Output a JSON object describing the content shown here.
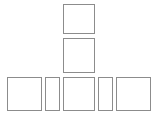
{
  "diagram": {
    "stroke_color": "#8c8c8c",
    "background": "#ffffff",
    "boxes": [
      {
        "id": "top",
        "x": 63,
        "y": 4,
        "w": 32,
        "h": 30
      },
      {
        "id": "middle",
        "x": 63,
        "y": 38,
        "w": 32,
        "h": 35
      },
      {
        "id": "bottom-left",
        "x": 7,
        "y": 77,
        "w": 35,
        "h": 34
      },
      {
        "id": "bottom-left-narrow",
        "x": 45,
        "y": 77,
        "w": 15,
        "h": 34
      },
      {
        "id": "bottom-center",
        "x": 63,
        "y": 77,
        "w": 32,
        "h": 34
      },
      {
        "id": "bottom-right-narrow",
        "x": 98,
        "y": 77,
        "w": 15,
        "h": 34
      },
      {
        "id": "bottom-right",
        "x": 116,
        "y": 77,
        "w": 35,
        "h": 34
      }
    ]
  }
}
